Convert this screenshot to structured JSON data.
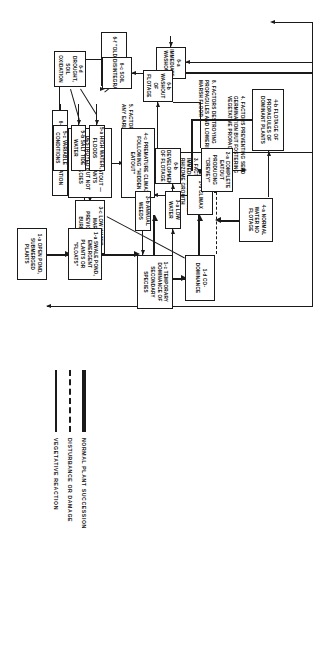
{
  "diagram": {
    "nodes": {
      "flotage_propagules": {
        "tag": "4-b",
        "label": "FLOTAGE OF PROPAGULES OF DOMINANT PLANTS"
      },
      "normal_water": {
        "tag": "4-a",
        "label": "NORMAL WATER NO FLOTAGE"
      },
      "climax": {
        "tag": "1-d",
        "label": "CLIMAX"
      },
      "codominance": {
        "tag": "1-d",
        "label": "CO-DOMINANCE"
      },
      "premature_climax": {
        "tag": "4-c",
        "label": "PREMATURE CLIMAX FOLLOWING \"HIDDEN EATOUT\""
      },
      "partial_eatout": {
        "tag": "2-b",
        "label": "PARTIAL EATOUT — FOOD— PLANTS DESTROYED BUT NOT CLIMAX SPECIES"
      },
      "low_water_burned": {
        "tag": "3-c",
        "label": "LOW WATER, MARSH PREVIOUSLY BURNED"
      },
      "old_crevey": {
        "tag": "6-f",
        "label": "\"OLD CREVEY\""
      },
      "soil_disint_left": {
        "tag": "6-e",
        "label": "SOIL DISINTEGRATION"
      },
      "complete_eatout": {
        "tag": "2-a",
        "label": "COMPLETE EATOUT PRODUCING \"CREVEY\""
      },
      "temporary_dominance": {
        "tag": "1-c",
        "label": "TEMPORARY DOMINANCE OF SECONDARY SPECIES"
      },
      "low_water": {
        "tag": "3-a",
        "label": "LOW WATER"
      },
      "annual_weeds": {
        "tag": "3-b",
        "label": "ANNUAL WEEDS"
      },
      "development_flotage": {
        "tag": "6-b",
        "label": "DEVELOPMENT OF FLOTAGE"
      },
      "immediate_washout": {
        "tag": "6-a",
        "label": "IMMEDIATE WASHOUT"
      },
      "washout_flotage": {
        "tag": "6-b",
        "label": "WASHOUT OF FLOTAGE"
      },
      "soil_disint_right": {
        "tag": "6-c",
        "label": "SOIL DISINTEGRATION"
      },
      "drought_oxidation": {
        "tag": "6-d",
        "label": "DROUGHT, SOIL OXIDATION"
      },
      "high_water_floods": {
        "tag": "5-a",
        "label": "HIGH WATER, FLOODS"
      },
      "salt_tide_water": {
        "tag": "5-b",
        "label": "SALT TIDE WATER"
      },
      "variable_conditions": {
        "tag": "5-c",
        "label": "VARIABLE CONDITIONS"
      },
      "swale_pond": {
        "tag": "1-a",
        "label": "SWALE POND, EMERGENT PLANTS OR \"FLOATS\""
      },
      "open_pond": {
        "tag": "1-a",
        "label": "OPEN POND, SUBMERGED PLANTS"
      }
    },
    "captions": {
      "factors_4": "4. FACTORS PREVENTING SEED GERMINATION BUT FOSTERING VEGETATIVE PROPAGATION",
      "factors_8": "8. FACTORS DESTROYING PROPAGULES AND LOWERING MARSH FLOOR",
      "factors_3": "3. FACTORS FAVORING IMMEDIATE SEED AND RHIZOME GROWTH",
      "factors_5": "5. FACTORS PREVENTING ANY EARLY RECOVERY"
    },
    "legend": {
      "items": [
        {
          "key": "solid-thick",
          "label": "NORMAL PLANT SUCCESSION"
        },
        {
          "key": "dashed",
          "label": "DISTURBANCE OR DAMAGE"
        },
        {
          "key": "solid-thin",
          "label": "VEGETATIVE  REACTION"
        }
      ]
    },
    "colors": {
      "ink": "#1a1a1a",
      "paper": "#ffffff"
    }
  }
}
